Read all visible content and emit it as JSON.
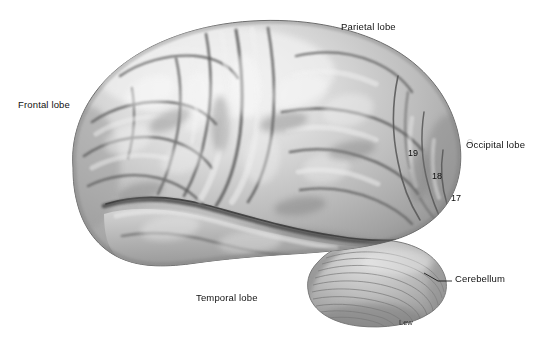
{
  "figure": {
    "view": "left lateral",
    "background_color": "#ffffff",
    "ink_color": "#111111",
    "tissue_light": "#e9e9e9",
    "tissue_mid": "#b9b9b9",
    "tissue_dark": "#8a8a8a",
    "sulcus_color": "#5d5d5d"
  },
  "labels": {
    "frontal": "Frontal lobe",
    "parietal": "Parietal lobe",
    "occipital": "Occipital lobe",
    "temporal": "Temporal lobe",
    "cerebellum": "Cerebellum"
  },
  "brodmann_areas": [
    {
      "number": "19"
    },
    {
      "number": "18"
    },
    {
      "number": "17"
    }
  ],
  "signature": "Lew",
  "top_faint_text": {
    "left": "",
    "right": ""
  }
}
